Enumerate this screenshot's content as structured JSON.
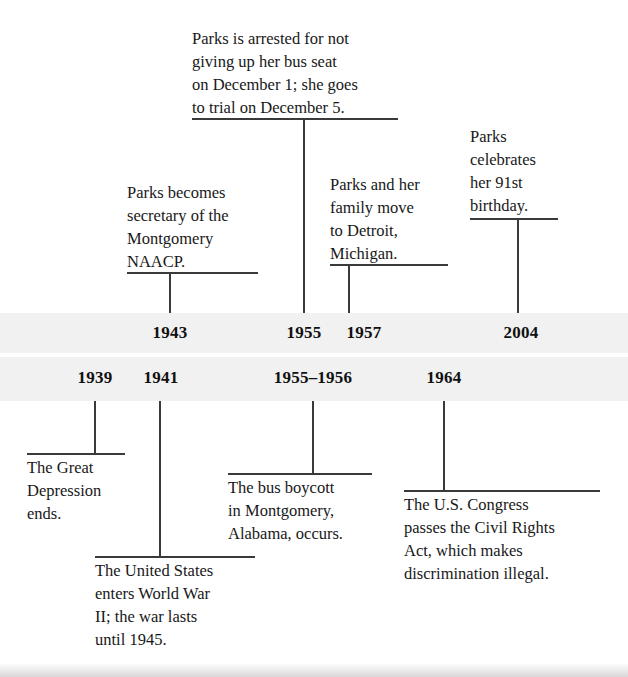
{
  "timeline": {
    "title": "Rosa Parks and United States history timeline",
    "band_color": "#f1f1f1",
    "line_color": "#3a3a3a",
    "upper_events": [
      {
        "year": "1943",
        "text": "Parks becomes\nsecretary of the\nMontgomery\nNAACP."
      },
      {
        "year": "1955",
        "text": "Parks is arrested for not\ngiving up her bus seat\non December 1; she goes\nto trial on December 5."
      },
      {
        "year": "1957",
        "text": "Parks and her\nfamily move\nto Detroit,\nMichigan."
      },
      {
        "year": "2004",
        "text": "Parks\ncelebrates\nher 91st\nbirthday."
      }
    ],
    "lower_events": [
      {
        "year": "1939",
        "text": "The Great\nDepression\nends."
      },
      {
        "year": "1941",
        "text": "The United States\nenters World War\nII; the war lasts\nuntil 1945."
      },
      {
        "year": "1955–1956",
        "text": "The bus boycott\nin Montgomery,\nAlabama, occurs."
      },
      {
        "year": "1964",
        "text": "The U.S. Congress\npasses the Civil Rights\nAct, which makes\ndiscrimination illegal."
      }
    ]
  }
}
